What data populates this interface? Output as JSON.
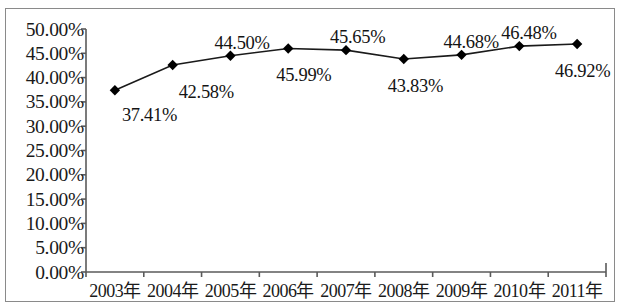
{
  "chart_data": {
    "type": "line",
    "title": "",
    "subtitle": "",
    "xlabel": "",
    "ylabel": "",
    "categories": [
      "2003年",
      "2004年",
      "2005年",
      "2006年",
      "2007年",
      "2008年",
      "2009年",
      "2010年",
      "2011年"
    ],
    "values": [
      37.41,
      42.58,
      44.5,
      45.99,
      45.65,
      43.83,
      44.68,
      46.48,
      46.92
    ],
    "point_labels": [
      "37.41%",
      "42.58%",
      "44.50%",
      "45.99%",
      "45.65%",
      "43.83%",
      "44.68%",
      "46.48%",
      "46.92%"
    ],
    "ylim": [
      0,
      50
    ],
    "ytick_values": [
      50,
      45,
      40,
      35,
      30,
      25,
      20,
      15,
      10,
      5,
      0
    ],
    "ytick_labels": [
      "50.00%",
      "45.00%",
      "40.00%",
      "35.00%",
      "30.00%",
      "25.00%",
      "20.00%",
      "15.00%",
      "10.00%",
      "5.00%",
      "0.00%"
    ],
    "grid": false,
    "legend": "none",
    "series_color": "#1a1a1a",
    "marker": "diamond",
    "marker_color": "#000000",
    "axis_color": "#5a5a5a",
    "frame_color": "#8a8a8a",
    "background": "#ffffff",
    "label_offsets": [
      {
        "label": "37.41%",
        "dx": 7,
        "dy": 16
      },
      {
        "label": "42.58%",
        "dx": 6,
        "dy": 18
      },
      {
        "label": "44.50%",
        "dx": -16,
        "dy": -22
      },
      {
        "label": "45.99%",
        "dx": -12,
        "dy": 18
      },
      {
        "label": "45.65%",
        "dx": -16,
        "dy": -22
      },
      {
        "label": "43.83%",
        "dx": -16,
        "dy": 18
      },
      {
        "label": "44.68%",
        "dx": -18,
        "dy": -22
      },
      {
        "label": "46.48%",
        "dx": -18,
        "dy": -22
      },
      {
        "label": "46.92%",
        "dx": -22,
        "dy": 18
      }
    ]
  }
}
